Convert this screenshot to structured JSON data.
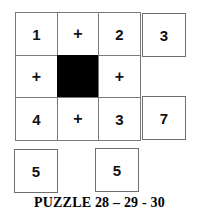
{
  "puzzle": {
    "caption": "PUZZLE 28 – 29 - 30",
    "grid": {
      "rows": 3,
      "cols": 3,
      "cells": [
        {
          "id": "r1c1",
          "value": "1",
          "kind": "number"
        },
        {
          "id": "r1c2",
          "value": "+",
          "kind": "operator"
        },
        {
          "id": "r1c3",
          "value": "2",
          "kind": "number"
        },
        {
          "id": "r2c1",
          "value": "+",
          "kind": "operator"
        },
        {
          "id": "r2c2",
          "value": "",
          "kind": "blocked"
        },
        {
          "id": "r2c3",
          "value": "+",
          "kind": "operator"
        },
        {
          "id": "r3c1",
          "value": "4",
          "kind": "number"
        },
        {
          "id": "r3c2",
          "value": "+",
          "kind": "operator"
        },
        {
          "id": "r3c3",
          "value": "3",
          "kind": "number"
        }
      ]
    },
    "row_results": [
      {
        "id": "row1-result",
        "value": "3"
      },
      {
        "id": "row3-result",
        "value": "7"
      }
    ],
    "column_results": [
      {
        "id": "col1-result",
        "value": "5"
      },
      {
        "id": "col3-result",
        "value": "5"
      }
    ]
  },
  "colors": {
    "background": "#ffffff",
    "border": "#7a7a7a",
    "blocked_fill": "#000000",
    "text": "#111111",
    "caption_text": "#000000"
  }
}
